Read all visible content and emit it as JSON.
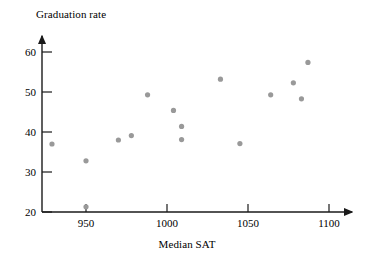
{
  "chart_data": {
    "type": "scatter",
    "title": "",
    "xlabel": "Median SAT",
    "ylabel": "Graduation rate",
    "xlim": [
      920,
      1115
    ],
    "ylim": [
      20,
      63
    ],
    "grid": false,
    "legend": null,
    "xticks": [
      950,
      1000,
      1050,
      1100
    ],
    "xtick_labels": [
      "950",
      "1000",
      "1050",
      "1100"
    ],
    "yticks": [
      20,
      30,
      40,
      50,
      60
    ],
    "ytick_labels": [
      "20",
      "30",
      "40",
      "50",
      "60"
    ],
    "marker_color": "#999999",
    "axis_color": "#1a1a1a",
    "points": [
      {
        "x": 929,
        "y": 37.0
      },
      {
        "x": 950,
        "y": 32.8
      },
      {
        "x": 950,
        "y": 21.3
      },
      {
        "x": 970,
        "y": 38.0
      },
      {
        "x": 978,
        "y": 39.1
      },
      {
        "x": 988,
        "y": 49.3
      },
      {
        "x": 1004,
        "y": 45.4
      },
      {
        "x": 1009,
        "y": 41.4
      },
      {
        "x": 1009,
        "y": 38.1
      },
      {
        "x": 1033,
        "y": 53.2
      },
      {
        "x": 1045,
        "y": 37.1
      },
      {
        "x": 1064,
        "y": 49.3
      },
      {
        "x": 1078,
        "y": 52.3
      },
      {
        "x": 1083,
        "y": 48.3
      },
      {
        "x": 1087,
        "y": 57.4
      }
    ]
  },
  "axes": {
    "y_title": "Graduation rate",
    "x_title": "Median SAT"
  }
}
